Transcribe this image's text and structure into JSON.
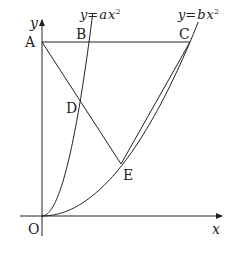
{
  "figure": {
    "axes": {
      "x_label": "x",
      "y_label": "y",
      "origin_label": "O"
    },
    "curves": [
      {
        "id": "curve-a",
        "y_part": "y",
        "eq_part": "=",
        "coef": "a",
        "var": "x",
        "exp": "2"
      },
      {
        "id": "curve-b",
        "y_part": "y",
        "eq_part": "=",
        "coef": "b",
        "var": "x",
        "exp": "2"
      }
    ],
    "points": {
      "A": "A",
      "B": "B",
      "C": "C",
      "D": "D",
      "E": "E"
    },
    "colors": {
      "ink": "#222222",
      "background": "#ffffff"
    }
  }
}
